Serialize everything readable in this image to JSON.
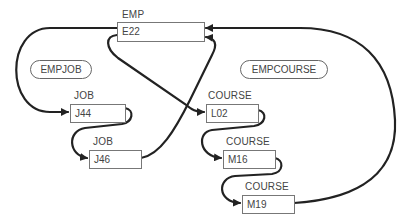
{
  "diagram": {
    "type": "network-database-set-occurrences",
    "colors": {
      "line": "#222222",
      "box_border": "#777777",
      "text": "#444444"
    },
    "owner": {
      "record_type": "EMP",
      "key": "E22"
    },
    "sets": [
      {
        "name": "EMPJOB",
        "members": [
          {
            "record_type": "JOB",
            "key": "J44"
          },
          {
            "record_type": "JOB",
            "key": "J46"
          }
        ]
      },
      {
        "name": "EMPCOURSE",
        "members": [
          {
            "record_type": "COURSE",
            "key": "L02"
          },
          {
            "record_type": "COURSE",
            "key": "M16"
          },
          {
            "record_type": "COURSE",
            "key": "M19"
          }
        ]
      }
    ]
  }
}
